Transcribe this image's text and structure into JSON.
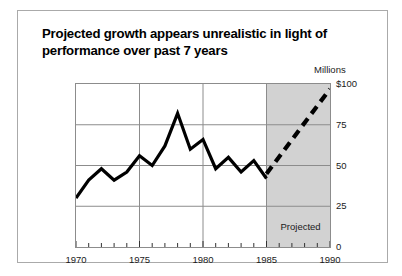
{
  "figure": {
    "title": "Projected growth appears unrealistic in light of performance over past 7 years",
    "units_label": "Millions",
    "projected_band_label": "Projected",
    "border_color": "#aaaaaa",
    "shade_color": "#d2d2d2",
    "line_color": "#000000"
  },
  "chart_data": {
    "type": "line",
    "title": "Projected growth appears unrealistic in light of performance over past 7 years",
    "xlabel": "",
    "ylabel": "Millions",
    "xlim": [
      1970,
      1990
    ],
    "ylim": [
      0,
      100
    ],
    "grid": true,
    "legend": false,
    "y_ticks": [
      0,
      25,
      50,
      75,
      100
    ],
    "y_tick_labels": [
      "0",
      "25",
      "50",
      "75",
      "$100"
    ],
    "x_ticks": [
      1970,
      1975,
      1980,
      1985,
      1990
    ],
    "x_tick_labels": [
      "1970",
      "1975",
      "1980",
      "1985",
      "1990"
    ],
    "x_minor_tick_interval": 1,
    "annotations": [
      {
        "text": "Projected",
        "x": 1987.3,
        "y": 12
      },
      {
        "text": "Millions",
        "x": 1990,
        "y": 106
      }
    ],
    "shaded_regions": [
      {
        "label": "Projected",
        "x_start": 1985,
        "x_end": 1990,
        "color": "#d2d2d2"
      }
    ],
    "series": [
      {
        "name": "Actual",
        "style": "solid",
        "x": [
          1970,
          1971,
          1972,
          1973,
          1974,
          1975,
          1976,
          1977,
          1978,
          1979,
          1980,
          1981,
          1982,
          1983,
          1984,
          1985
        ],
        "values": [
          30,
          41,
          48,
          41,
          46,
          56,
          50,
          62,
          82,
          60,
          66,
          48,
          55,
          46,
          53,
          42
        ]
      },
      {
        "name": "Projected",
        "style": "dashed",
        "x": [
          1985,
          1990
        ],
        "values": [
          45,
          97
        ]
      }
    ]
  }
}
